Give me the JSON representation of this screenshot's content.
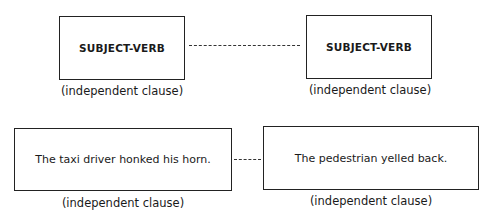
{
  "diagram": {
    "top_row": {
      "left_box": {
        "text": "SUBJECT-VERB",
        "label": "(independent clause)"
      },
      "right_box": {
        "text": "SUBJECT-VERB",
        "label": "(independent clause)"
      },
      "connector": "dashed"
    },
    "bottom_row": {
      "left_box": {
        "text": "The taxi driver honked his horn.",
        "label": "(independent clause)"
      },
      "right_box": {
        "text": "The pedestrian yelled back.",
        "label": "(independent clause)"
      },
      "connector": "dashed"
    }
  }
}
